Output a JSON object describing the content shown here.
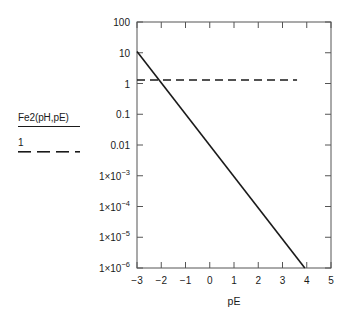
{
  "chart_data": {
    "type": "line",
    "title": "",
    "subtitle": "",
    "xlabel": "pE",
    "ylabel": "",
    "xlim": [
      -3,
      5
    ],
    "ylim": [
      1e-06,
      100
    ],
    "yscale": "log",
    "xscale": "linear",
    "grid": false,
    "legend_position": "left-outside",
    "x_ticks": [
      {
        "value": -3,
        "label": "−3"
      },
      {
        "value": -2,
        "label": "−2"
      },
      {
        "value": -1,
        "label": "−1"
      },
      {
        "value": 0,
        "label": "0"
      },
      {
        "value": 1,
        "label": "1"
      },
      {
        "value": 2,
        "label": "2"
      },
      {
        "value": 3,
        "label": "3"
      },
      {
        "value": 4,
        "label": "4"
      },
      {
        "value": 5,
        "label": "5"
      }
    ],
    "y_ticks": [
      {
        "value": 100,
        "mantissa": "100",
        "exponent": ""
      },
      {
        "value": 10,
        "mantissa": "10",
        "exponent": ""
      },
      {
        "value": 1,
        "mantissa": "1",
        "exponent": ""
      },
      {
        "value": 0.1,
        "mantissa": "0.1",
        "exponent": ""
      },
      {
        "value": 0.01,
        "mantissa": "0.01",
        "exponent": ""
      },
      {
        "value": 0.001,
        "mantissa": "1×10",
        "exponent": "−3"
      },
      {
        "value": 0.0001,
        "mantissa": "1×10",
        "exponent": "−4"
      },
      {
        "value": 1e-05,
        "mantissa": "1×10",
        "exponent": "−5"
      },
      {
        "value": 1e-06,
        "mantissa": "1×10",
        "exponent": "−6"
      }
    ],
    "series": [
      {
        "name": "Fe2(pH,pE)",
        "style": "solid",
        "color": "#1a1a1a",
        "points": [
          {
            "x": -3,
            "y": 11.0
          },
          {
            "x": 3.92,
            "y": 1e-06
          }
        ]
      },
      {
        "name": "1",
        "style": "dashed",
        "color": "#1a1a1a",
        "points": [
          {
            "x": -3,
            "y": 1.3
          },
          {
            "x": 3.6,
            "y": 1.3
          }
        ]
      }
    ]
  },
  "legend": {
    "entries": [
      {
        "label": "Fe2(pH,pE)",
        "style": "solid"
      },
      {
        "label": "1",
        "style": "dashed"
      }
    ]
  },
  "axes": {
    "x_title": "pE"
  },
  "colors": {
    "line": "#1a1a1a",
    "frame": "#555555",
    "background": "#ffffff",
    "text": "#1a1a1a"
  }
}
